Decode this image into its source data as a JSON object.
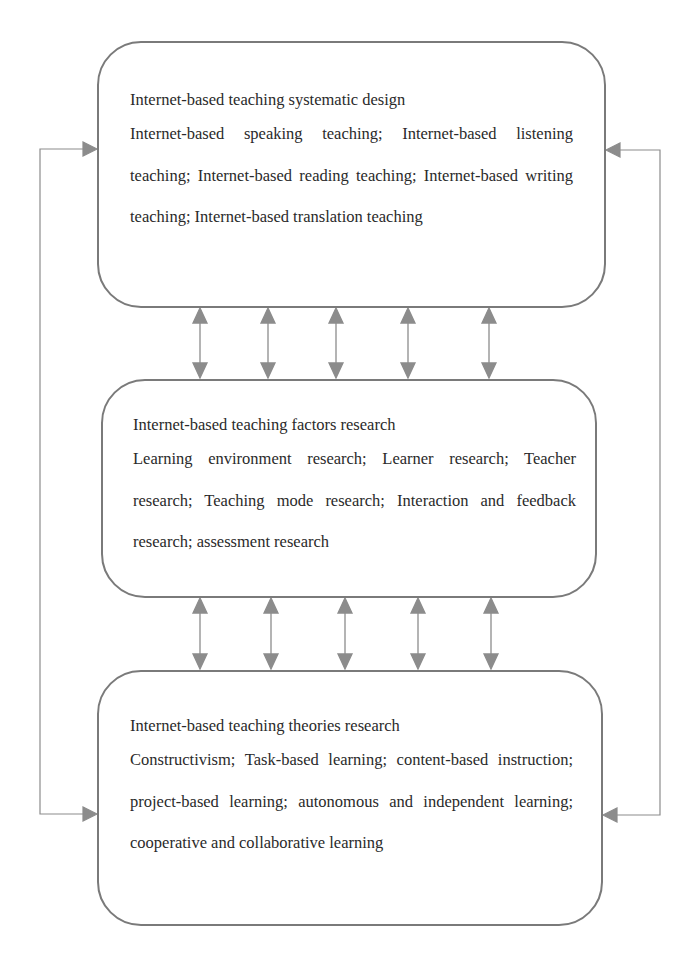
{
  "diagram": {
    "type": "flow",
    "colors": {
      "border": "#7a7a7a",
      "arrow": "#8c8c8c",
      "text": "#2a2a2a",
      "background": "#ffffff"
    },
    "boxes": [
      {
        "id": "design",
        "title": "Internet-based teaching systematic design",
        "body": "Internet-based speaking teaching; Internet-based listening teaching; Internet-based reading teaching; Internet-based writing teaching; Internet-based translation teaching"
      },
      {
        "id": "factors",
        "title": "Internet-based teaching factors research",
        "body": "Learning environment research; Learner research; Teacher research; Teaching mode research; Interaction and feedback research; assessment research"
      },
      {
        "id": "theories",
        "title": "Internet-based teaching theories research",
        "body": "Constructivism; Task-based learning; content-based instruction; project-based learning; autonomous and independent learning; cooperative and collaborative learning"
      }
    ],
    "connectors": {
      "design_factors": {
        "count": 5,
        "direction": "bidirectional",
        "x": [
          200,
          268,
          336,
          408,
          489
        ]
      },
      "factors_theories": {
        "count": 5,
        "direction": "bidirectional",
        "x": [
          200,
          271,
          345,
          418,
          491
        ]
      },
      "left_loop": {
        "from": "theories",
        "to": "design",
        "side": "left"
      },
      "right_loop": {
        "from": "design",
        "to": "theories",
        "side": "right"
      }
    }
  }
}
